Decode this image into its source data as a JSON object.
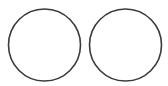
{
  "canvas": {
    "width": 168,
    "height": 86,
    "background": "#ffffff"
  },
  "stroke_color": "#3a3a3a",
  "stroke_width": 1.6,
  "circles": [
    {
      "id": "left",
      "cx": 44.5,
      "cy": 45,
      "r": 36
    },
    {
      "id": "right",
      "cx": 125.5,
      "cy": 45,
      "r": 36
    }
  ]
}
